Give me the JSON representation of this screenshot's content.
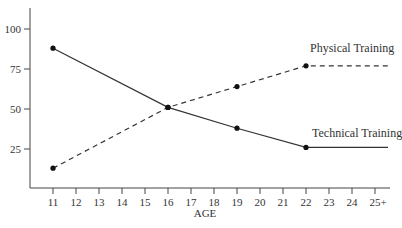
{
  "chart_data": {
    "type": "line",
    "title": "",
    "xlabel": "AGE",
    "ylabel": "",
    "categories": [
      "11",
      "12",
      "13",
      "14",
      "15",
      "16",
      "17",
      "18",
      "19",
      "20",
      "21",
      "22",
      "23",
      "24",
      "25+"
    ],
    "yticks": [
      25,
      50,
      75,
      100
    ],
    "ylim": [
      0,
      110
    ],
    "grid": false,
    "legend": "inline labels near line ends",
    "series": [
      {
        "name": "Physical Training",
        "style": "dashed",
        "points": [
          {
            "x": "11",
            "y": 13
          },
          {
            "x": "16",
            "y": 51
          },
          {
            "x": "19",
            "y": 64
          },
          {
            "x": "22",
            "y": 77
          },
          {
            "x": "25+",
            "y": 77
          }
        ],
        "markers": [
          "11",
          "16",
          "19",
          "22"
        ]
      },
      {
        "name": "Technical Training",
        "style": "solid",
        "points": [
          {
            "x": "11",
            "y": 88
          },
          {
            "x": "16",
            "y": 51
          },
          {
            "x": "19",
            "y": 38
          },
          {
            "x": "22",
            "y": 26
          },
          {
            "x": "25+",
            "y": 26
          }
        ],
        "markers": [
          "11",
          "16",
          "19",
          "22"
        ]
      }
    ]
  },
  "labels": {
    "xlabel": "AGE",
    "physical": "Physical Training",
    "technical": "Technical Training"
  }
}
